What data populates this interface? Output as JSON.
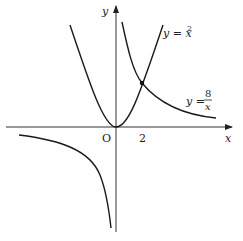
{
  "diagram": {
    "axes": {
      "x_label": "x",
      "y_label": "y",
      "origin_label": "O"
    },
    "ticks": [
      {
        "axis": "x",
        "label": "2"
      }
    ],
    "curves": [
      {
        "name": "parabola",
        "equation_lhs": "y = x",
        "exponent": "2"
      },
      {
        "name": "hyperbola",
        "equation_lhs": "y =",
        "numerator": "8",
        "denominator": "x"
      }
    ],
    "intersection": {
      "x": 2,
      "y": 4
    }
  }
}
